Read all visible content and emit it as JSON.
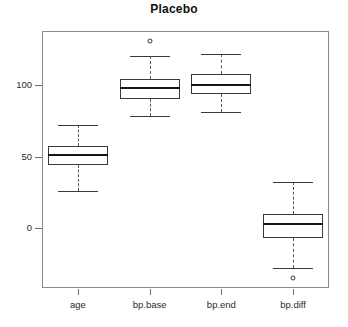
{
  "chart_data": {
    "type": "box",
    "title": "Placebo",
    "xlabel": "",
    "ylabel": "",
    "ylim": [
      -42,
      138
    ],
    "yticks": [
      0,
      50,
      100
    ],
    "ytick_labels": [
      "0",
      "50",
      "100"
    ],
    "grid": false,
    "legend": null,
    "categories": [
      "age",
      "bp.base",
      "bp.end",
      "bp.diff"
    ],
    "boxes": [
      {
        "name": "age",
        "whisker_low": 26,
        "q1": 44,
        "median": 51,
        "q3": 57,
        "whisker_high": 72,
        "outliers": []
      },
      {
        "name": "bp.base",
        "whisker_low": 78,
        "q1": 90,
        "median": 98,
        "q3": 104,
        "whisker_high": 120,
        "outliers": [
          131
        ]
      },
      {
        "name": "bp.end",
        "whisker_low": 81,
        "q1": 94,
        "median": 100,
        "q3": 108,
        "whisker_high": 122,
        "outliers": []
      },
      {
        "name": "bp.diff",
        "whisker_low": -28,
        "q1": -7,
        "median": 3,
        "q3": 10,
        "whisker_high": 32,
        "outliers": [
          -35
        ]
      }
    ]
  },
  "colors": {
    "frame": "#8a8a8a",
    "box_outline": "#3a3a3a",
    "median": "#151515",
    "whisker": "#555555",
    "text": "#1a1a1a",
    "background": "#ffffff"
  }
}
